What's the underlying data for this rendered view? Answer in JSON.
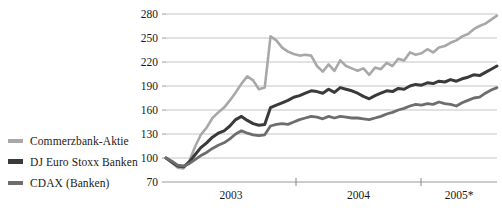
{
  "chart_data": {
    "type": "line",
    "title": "",
    "xlabel": "",
    "ylabel": "",
    "ylim": [
      70,
      280
    ],
    "yticks": [
      70,
      100,
      130,
      160,
      190,
      220,
      250,
      280
    ],
    "xticks": [
      "2003",
      "2004",
      "2005*"
    ],
    "grid": true,
    "legend_position": "left",
    "baseline": 100,
    "x": [
      0,
      1,
      2,
      3,
      4,
      5,
      6,
      7,
      8,
      9,
      10,
      11,
      12,
      13,
      14,
      15,
      16,
      17,
      18,
      19,
      20,
      21,
      22,
      23,
      24,
      25,
      26,
      27,
      28,
      29,
      30,
      31,
      32,
      33,
      34,
      35,
      36,
      37,
      38,
      39,
      40,
      41,
      42,
      43,
      44,
      45,
      46,
      47,
      48,
      49,
      50,
      51,
      52,
      53,
      54,
      55,
      56,
      57
    ],
    "series": [
      {
        "name": "Commerzbank-Aktie",
        "color": "#a8a8a8",
        "width": 2.6,
        "values": [
          100,
          94,
          88,
          87,
          96,
          114,
          129,
          138,
          150,
          157,
          163,
          172,
          182,
          193,
          202,
          197,
          186,
          188,
          252,
          247,
          238,
          233,
          230,
          228,
          229,
          228,
          215,
          208,
          217,
          209,
          222,
          215,
          212,
          209,
          212,
          204,
          213,
          211,
          219,
          215,
          224,
          222,
          232,
          229,
          231,
          236,
          232,
          238,
          240,
          244,
          247,
          252,
          255,
          261,
          265,
          268,
          273,
          278
        ]
      },
      {
        "name": "DJ Euro Stoxx Banken",
        "color": "#3a3a3a",
        "width": 3.0,
        "values": [
          100,
          95,
          90,
          89,
          95,
          104,
          113,
          119,
          126,
          131,
          134,
          140,
          148,
          152,
          147,
          143,
          141,
          142,
          163,
          166,
          169,
          172,
          176,
          178,
          181,
          184,
          183,
          181,
          186,
          182,
          188,
          186,
          184,
          181,
          177,
          174,
          178,
          181,
          184,
          183,
          187,
          186,
          190,
          192,
          191,
          194,
          193,
          196,
          195,
          198,
          196,
          199,
          201,
          204,
          203,
          207,
          211,
          215
        ]
      },
      {
        "name": "CDAX (Banken)",
        "color": "#6d6d6d",
        "width": 2.8,
        "values": [
          100,
          96,
          91,
          90,
          93,
          98,
          103,
          107,
          112,
          116,
          119,
          124,
          130,
          134,
          131,
          129,
          128,
          129,
          140,
          142,
          143,
          142,
          145,
          148,
          150,
          152,
          151,
          149,
          152,
          150,
          152,
          151,
          150,
          150,
          149,
          148,
          150,
          152,
          155,
          157,
          160,
          162,
          165,
          167,
          166,
          168,
          167,
          170,
          168,
          167,
          165,
          169,
          172,
          175,
          176,
          181,
          185,
          188
        ]
      }
    ]
  },
  "legend": {
    "items": [
      {
        "label": "Commerzbank-Aktie",
        "color": "#a8a8a8"
      },
      {
        "label": "DJ Euro Stoxx Banken",
        "color": "#3a3a3a"
      },
      {
        "label": "CDAX (Banken)",
        "color": "#6d6d6d"
      }
    ]
  },
  "axis": {
    "y_labels": [
      "280",
      "250",
      "220",
      "190",
      "160",
      "130",
      "100",
      "70"
    ],
    "x_labels": [
      "2003",
      "2004",
      "2005*"
    ]
  }
}
